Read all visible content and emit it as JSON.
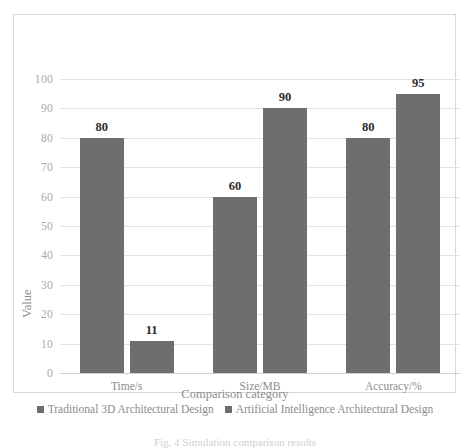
{
  "chart_data": {
    "type": "bar",
    "title": "",
    "categories": [
      "Time/s",
      "Size/MB",
      "Accuracy/%"
    ],
    "series": [
      {
        "name": "Traditional 3D Architectural Design",
        "values": [
          80,
          60,
          80
        ],
        "color": "#6e6e6e"
      },
      {
        "name": "Artificial Intelligence Architectural Design",
        "values": [
          11,
          90,
          95
        ],
        "color": "#6e6e6e"
      }
    ],
    "xlabel": "Comparison category",
    "ylabel": "Value",
    "ylim": [
      0,
      100
    ],
    "ytick_step": 10,
    "yticks": [
      "100",
      "90",
      "80",
      "70",
      "60",
      "50",
      "40",
      "30",
      "20",
      "10",
      "0"
    ],
    "grid": true,
    "legend_position": "bottom"
  },
  "axis": {
    "y_title": "Value",
    "x_title": "Comparison category"
  },
  "caption": {
    "text": "Fig. 4  Simulation comparison results"
  },
  "colors": {
    "bar": "#6e6e6e",
    "gridline": "#e2e2e2",
    "frame": "#d9d9d9",
    "tick_text": "#a8a8a8",
    "label_text": "#2b2b2b"
  }
}
